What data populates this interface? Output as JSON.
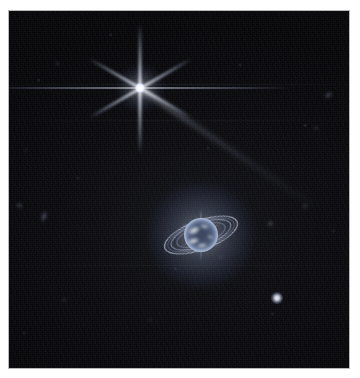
{
  "image": {
    "kind": "astronomical-photograph",
    "subject": "Neptune and its rings with Triton and background galaxies",
    "instrument_pattern": "six-point-diffraction-spikes",
    "background_color": "#060608",
    "border_color": "#ffffff",
    "frame": {
      "left": 9,
      "top": 11,
      "width": 340,
      "height": 357
    },
    "caption": ""
  },
  "objects": {
    "bright_star": {
      "name": "triton-bright-star",
      "label": "Triton",
      "x": 140,
      "y": 88,
      "core_size": 10,
      "halo_size": 46,
      "color": "#ffffff",
      "spikes": [
        {
          "angle": 90,
          "length": 130,
          "width": 3.0,
          "opacity": 0.92
        },
        {
          "angle": 30,
          "length": 118,
          "width": 2.6,
          "opacity": 0.82
        },
        {
          "angle": 150,
          "length": 118,
          "width": 2.6,
          "opacity": 0.82
        },
        {
          "angle": 0,
          "length": 300,
          "width": 1.4,
          "opacity": 0.5
        }
      ],
      "long_spike": {
        "angle": 34,
        "length": 210,
        "width": 4.5,
        "opacity": 0.4
      }
    },
    "planet": {
      "name": "neptune",
      "label": "Neptune",
      "x": 201,
      "y": 235,
      "disk_radius": 17,
      "glow_radius": 52,
      "limb_color": "#e8f1ff",
      "disk_color": "#6d7f9e",
      "clouds": [
        {
          "x": -7,
          "y": -5,
          "w": 12,
          "h": 7,
          "rot": -25,
          "opacity": 0.85
        },
        {
          "x": -8,
          "y": 6,
          "w": 11,
          "h": 6,
          "rot": -15,
          "opacity": 0.8
        },
        {
          "x": 3,
          "y": -9,
          "w": 9,
          "h": 5,
          "rot": 10,
          "opacity": 0.55
        },
        {
          "x": 1,
          "y": 10,
          "w": 10,
          "h": 5,
          "rot": -8,
          "opacity": 0.6
        },
        {
          "x": 9,
          "y": 2,
          "w": 7,
          "h": 4,
          "rot": 20,
          "opacity": 0.45
        }
      ],
      "spikes": [
        {
          "angle": 90,
          "length": 54,
          "width": 2.2,
          "opacity": 0.45
        },
        {
          "angle": 30,
          "length": 46,
          "width": 2.0,
          "opacity": 0.38
        },
        {
          "angle": 150,
          "length": 46,
          "width": 2.0,
          "opacity": 0.38
        }
      ]
    },
    "ring_system": {
      "name": "neptune-rings",
      "tilt_deg": -20,
      "rings": [
        {
          "id": "adams-ring",
          "rx": 38.0,
          "ry": 14.0,
          "thickness": 1.1,
          "opacity": 0.78,
          "color": "#dbe6fb"
        },
        {
          "id": "le-verrier-ring",
          "rx": 31.0,
          "ry": 11.2,
          "thickness": 0.9,
          "opacity": 0.6,
          "color": "#cfdcf6"
        },
        {
          "id": "galle-ring",
          "rx": 25.0,
          "ry": 9.0,
          "thickness": 0.8,
          "opacity": 0.42,
          "color": "#c2d2f0"
        },
        {
          "id": "lassell-band",
          "rx": 34.5,
          "ry": 12.6,
          "thickness": 0.7,
          "opacity": 0.3,
          "color": "#b8c9ec"
        }
      ]
    },
    "point_sources": [
      {
        "name": "moon-or-star-lower-right",
        "x": 277,
        "y": 298,
        "size": 12,
        "brightness": 0.95
      },
      {
        "name": "faint-source-right-of-neptune",
        "x": 270,
        "y": 223,
        "size": 7,
        "brightness": 0.45
      },
      {
        "name": "faint-source-upper-right",
        "x": 305,
        "y": 206,
        "size": 6,
        "brightness": 0.35
      },
      {
        "name": "faint-source-below-rings",
        "x": 221,
        "y": 257,
        "size": 4,
        "brightness": 0.3
      },
      {
        "name": "faint-source-upper-left",
        "x": 57,
        "y": 63,
        "size": 5,
        "brightness": 0.28
      },
      {
        "name": "faint-source-mid-left",
        "x": 26,
        "y": 150,
        "size": 4,
        "brightness": 0.22
      },
      {
        "name": "faint-source-lower-mid",
        "x": 150,
        "y": 320,
        "size": 4,
        "brightness": 0.2
      }
    ],
    "galaxies": [
      {
        "name": "galaxy-left-edge",
        "x": 19,
        "y": 205,
        "w": 7,
        "h": 5,
        "rot": 30,
        "brightness": 0.4
      },
      {
        "name": "galaxy-left-inner",
        "x": 44,
        "y": 216,
        "w": 6,
        "h": 11,
        "rot": 18,
        "brightness": 0.5
      },
      {
        "name": "galaxy-right-edge",
        "x": 328,
        "y": 95,
        "w": 9,
        "h": 6,
        "rot": -35,
        "brightness": 0.42
      },
      {
        "name": "galaxy-upper-right",
        "x": 316,
        "y": 128,
        "w": 6,
        "h": 4,
        "rot": 10,
        "brightness": 0.25
      },
      {
        "name": "galaxy-bottom-left",
        "x": 64,
        "y": 300,
        "w": 6,
        "h": 4,
        "rot": -20,
        "brightness": 0.22
      }
    ],
    "detector_streaks": [
      {
        "name": "streak-upper",
        "y": 84,
        "opacity": 0.3
      },
      {
        "name": "streak-mid",
        "y": 120,
        "opacity": 0.18
      },
      {
        "name": "streak-lower",
        "y": 265,
        "opacity": 0.14
      }
    ]
  }
}
